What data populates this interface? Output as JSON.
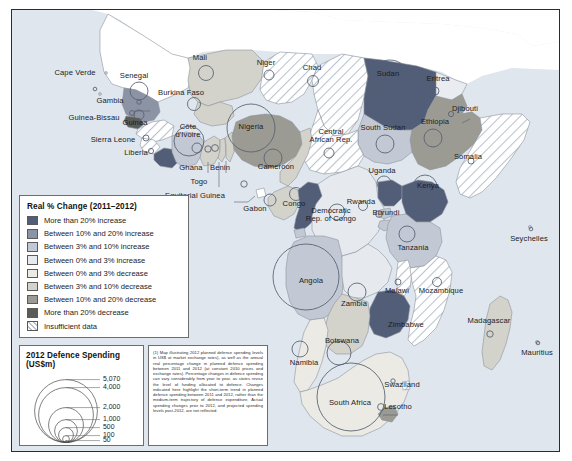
{
  "figure": {
    "type": "choropleth-proportional-symbol-map",
    "region": "Sub-Saharan Africa"
  },
  "choropleth_legend": {
    "title": "Real % Change (2011–2012)",
    "items": [
      {
        "label": "More than 20% increase",
        "color": "#525d78"
      },
      {
        "label": "Between 10% and 20% increase",
        "color": "#8c93a5"
      },
      {
        "label": "Between 3% and 10% increase",
        "color": "#c3c9d4"
      },
      {
        "label": "Between 0% and 3% increase",
        "color": "#e6eaef"
      },
      {
        "label": "Between 0% and 3% decrease",
        "color": "#eceae4"
      },
      {
        "label": "Between 3% and 10% decrease",
        "color": "#d3d2cb"
      },
      {
        "label": "Between 10% and 20% decrease",
        "color": "#9b9b94"
      },
      {
        "label": "More than 20% decrease",
        "color": "#5c5c57"
      },
      {
        "label": "Insufficient data",
        "color": "hatch"
      }
    ]
  },
  "bubble_legend": {
    "title": "2012 Defence Spending (US$m)",
    "values": [
      "5,070",
      "4,000",
      "2,000",
      "1,000",
      "500",
      "100",
      "50"
    ]
  },
  "note": {
    "text": "(1) Map illustrating 2012 planned defence spending levels in US$ at market exchange rates), as well as the annual real percentage change in planned defence spending between 2011 and 2012 (at constant 2010 prices and exchange rates). Percentage changes in defence spending can vary considerably from year to year, as states revise the level of funding allocated to defence. Changes indicated here highlight the short-term trend in planned defence spending between 2011 and 2012, rather than the medium-term trajectory of defence expenditure. Actual spending changes prior to 2012, and projected spending levels post-2012, are not reflected."
  },
  "chart_data": {
    "type": "map",
    "title": "2012 Defence Spending (US$m)",
    "legend_position": "bottom-left",
    "value_field": "2012 defence spending (US$m)",
    "color_field": "Real % change 2011–2012",
    "countries": [
      {
        "name": "Cape Verde",
        "x": 74,
        "y": 72,
        "cx": 94,
        "cy": 88,
        "r": 1.8,
        "band": "insufficient"
      },
      {
        "name": "Senegal",
        "x": 133,
        "y": 75,
        "cx": 138,
        "cy": 90,
        "r": 9,
        "band": "inc10_20"
      },
      {
        "name": "Gambia",
        "x": 109,
        "y": 100,
        "cx": 138,
        "cy": 101,
        "r": 2.2,
        "band": "inc10_20"
      },
      {
        "name": "Guinea-Bissau",
        "x": 93,
        "y": 117,
        "cx": 131,
        "cy": 112,
        "r": 2.4,
        "band": "dec_more20"
      },
      {
        "name": "Guinea",
        "x": 134,
        "y": 122,
        "cx": 138,
        "cy": 114,
        "r": 5,
        "band": "insufficient"
      },
      {
        "name": "Sierra Leone",
        "x": 112,
        "y": 139,
        "cx": 145,
        "cy": 137,
        "r": 3,
        "band": "insufficient"
      },
      {
        "name": "Liberia",
        "x": 135,
        "y": 152,
        "cx": 150,
        "cy": 150,
        "r": 2.6,
        "band": "inc_more20"
      },
      {
        "name": "Mali",
        "x": 199,
        "y": 57,
        "cx": 205,
        "cy": 72,
        "r": 7.5,
        "band": "dec3_10"
      },
      {
        "name": "Burkina Faso",
        "x": 180,
        "y": 92,
        "cx": 193,
        "cy": 103,
        "r": 6.5,
        "band": "dec3_10"
      },
      {
        "name": "Côte d'Ivoire",
        "x": 187,
        "y": 130,
        "cx": 188,
        "cy": 140,
        "r": 15,
        "band": "inc3_10"
      },
      {
        "name": "Ghana",
        "x": 190,
        "y": 167,
        "cx": 196,
        "cy": 147,
        "r": 5,
        "band": "dec3_10"
      },
      {
        "name": "Togo",
        "x": 198,
        "y": 181,
        "cx": 207,
        "cy": 148,
        "r": 3.2,
        "band": "dec3_10"
      },
      {
        "name": "Benin",
        "x": 219,
        "y": 167,
        "cx": 214,
        "cy": 147,
        "r": 3.4,
        "band": "dec3_10"
      },
      {
        "name": "Niger",
        "x": 265,
        "y": 62,
        "cx": 268,
        "cy": 74,
        "r": 5,
        "band": "insufficient"
      },
      {
        "name": "Nigeria",
        "x": 250,
        "y": 126,
        "cx": 250,
        "cy": 127,
        "r": 24,
        "band": "dec10_20"
      },
      {
        "name": "Equitorial Guinea",
        "x": 194,
        "y": 195,
        "cx": 243,
        "cy": 183,
        "r": 3.2,
        "band": "insufficient"
      },
      {
        "name": "Cameroon",
        "x": 275,
        "y": 166,
        "cx": 272,
        "cy": 157,
        "r": 9,
        "band": "dec3_10"
      },
      {
        "name": "Chad",
        "x": 311,
        "y": 67,
        "cx": 312,
        "cy": 80,
        "r": 5.5,
        "band": "insufficient"
      },
      {
        "name": "Central African Rep.",
        "x": 330,
        "y": 135,
        "cx": 328,
        "cy": 152,
        "r": 5,
        "band": "insufficient"
      },
      {
        "name": "Sudan",
        "x": 387,
        "y": 73,
        "cx": 389,
        "cy": 79,
        "r": 20,
        "band": "inc_more20"
      },
      {
        "name": "Eritrea",
        "x": 437,
        "y": 78,
        "cx": 434,
        "cy": 90,
        "r": 4,
        "band": "insufficient"
      },
      {
        "name": "Djibouti",
        "x": 464,
        "y": 108,
        "cx": 450,
        "cy": 113,
        "r": 2.6,
        "band": "insufficient"
      },
      {
        "name": "Ethiopia",
        "x": 434,
        "y": 121,
        "cx": 432,
        "cy": 137,
        "r": 9,
        "band": "dec10_20"
      },
      {
        "name": "South Sudan",
        "x": 382,
        "y": 127,
        "cx": 384,
        "cy": 143,
        "r": 9,
        "band": "inc3_10"
      },
      {
        "name": "Somalia",
        "x": 467,
        "y": 156,
        "cx": 470,
        "cy": 160,
        "r": 3,
        "band": "insufficient"
      },
      {
        "name": "Uganda",
        "x": 381,
        "y": 170,
        "cx": 383,
        "cy": 182,
        "r": 7,
        "band": "inc_more20"
      },
      {
        "name": "Kenya",
        "x": 427,
        "y": 185,
        "cx": 424,
        "cy": 186,
        "r": 12,
        "band": "inc_more20"
      },
      {
        "name": "Rwanda",
        "x": 360,
        "y": 201,
        "cx": 362,
        "cy": 205,
        "r": 4.5,
        "band": "inc3_10"
      },
      {
        "name": "Burundi",
        "x": 385,
        "y": 212,
        "cx": 378,
        "cy": 213,
        "r": 3.4,
        "band": "inc3_10"
      },
      {
        "name": "Gabon",
        "x": 254,
        "y": 208,
        "cx": 269,
        "cy": 199,
        "r": 6,
        "band": "dec3_10"
      },
      {
        "name": "Congo",
        "x": 293,
        "y": 203,
        "cx": 295,
        "cy": 193,
        "r": 6.5,
        "band": "inc_more20"
      },
      {
        "name": "Democratic Rep. of Congo",
        "x": 330,
        "y": 214,
        "cx": 336,
        "cy": 211,
        "r": 8,
        "band": "inc0_3"
      },
      {
        "name": "Tanzania",
        "x": 412,
        "y": 247,
        "cx": 406,
        "cy": 233,
        "r": 8,
        "band": "inc3_10"
      },
      {
        "name": "Angola",
        "x": 310,
        "y": 280,
        "cx": 305,
        "cy": 276,
        "r": 33,
        "band": "inc3_10"
      },
      {
        "name": "Zambia",
        "x": 353,
        "y": 303,
        "cx": 356,
        "cy": 291,
        "r": 9,
        "band": "inc0_3"
      },
      {
        "name": "Malawi",
        "x": 396,
        "y": 290,
        "cx": 397,
        "cy": 281,
        "r": 3,
        "band": "insufficient"
      },
      {
        "name": "Mozambique",
        "x": 440,
        "y": 290,
        "cx": 436,
        "cy": 281,
        "r": 4.5,
        "band": "insufficient"
      },
      {
        "name": "Zimbabwe",
        "x": 405,
        "y": 324,
        "cx": 386,
        "cy": 325,
        "r": 10,
        "band": "inc_more20"
      },
      {
        "name": "Botswana",
        "x": 341,
        "y": 340,
        "cx": 338,
        "cy": 352,
        "r": 12,
        "band": "dec3_10"
      },
      {
        "name": "Namibia",
        "x": 303,
        "y": 362,
        "cx": 299,
        "cy": 348,
        "r": 8,
        "band": "dec0_3"
      },
      {
        "name": "South Africa",
        "x": 349,
        "y": 402,
        "cx": 350,
        "cy": 396,
        "r": 34,
        "band": "dec0_3"
      },
      {
        "name": "Swaziland",
        "x": 401,
        "y": 384,
        "cx": 392,
        "cy": 380,
        "r": 2.2,
        "band": "insufficient"
      },
      {
        "name": "Lesotho",
        "x": 397,
        "y": 406,
        "cx": 380,
        "cy": 406,
        "r": 3.4,
        "band": "dec10_20"
      },
      {
        "name": "Madagascar",
        "x": 488,
        "y": 320,
        "cx": 489,
        "cy": 333,
        "r": 3.2,
        "band": "dec3_10"
      },
      {
        "name": "Seychelles",
        "x": 528,
        "y": 238,
        "cx": 530,
        "cy": 228,
        "r": 1.8,
        "band": "insufficient"
      },
      {
        "name": "Mauritius",
        "x": 536,
        "y": 352,
        "cx": 537,
        "cy": 342,
        "r": 1.8,
        "band": "insufficient"
      }
    ]
  }
}
